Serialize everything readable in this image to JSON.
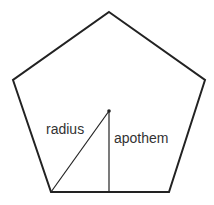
{
  "diagram": {
    "shape": "regular pentagon",
    "labels": {
      "radius": "radius",
      "apothem": "apothem"
    },
    "colors": {
      "stroke": "#222222",
      "text": "#333333",
      "background": "#ffffff"
    }
  }
}
